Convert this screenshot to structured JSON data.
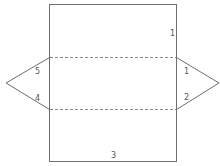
{
  "diagram": {
    "type": "triangular-prism-net",
    "colors": {
      "line": "#6e6e6e",
      "dashed_line": "#8a8a8a",
      "label": "#555555",
      "background": "#ffffff"
    },
    "labels": {
      "rect_top_right": "1",
      "left_triangle_upper": "5",
      "left_triangle_lower": "4",
      "right_triangle_upper": "1",
      "right_triangle_lower": "2",
      "rect_bottom": "3"
    }
  }
}
